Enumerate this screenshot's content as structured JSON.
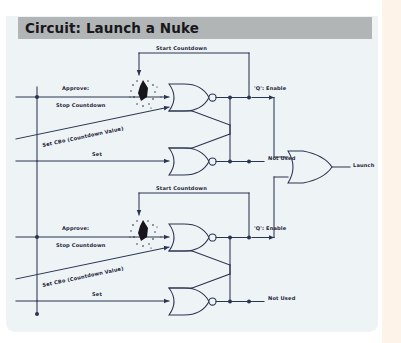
{
  "header": {
    "title": "Circuit: Launch a Nuke"
  },
  "colors": {
    "page_background": "#eef3f6",
    "header_bar": "#b2b5b5",
    "wire": "#2b3450",
    "text": "#1d2436",
    "gutter": "#fdf3e8",
    "burst": "#16161c"
  },
  "diagram": {
    "type": "logic-circuit",
    "final_output_label": "Launch",
    "final_gate": "OR",
    "latches": [
      {
        "id": "latch-top",
        "gates": [
          "NOR",
          "NOR"
        ],
        "inputs": [
          {
            "name": "approve",
            "label": "Approve:"
          },
          {
            "name": "stop-countdown",
            "label": "Stop Countdown"
          },
          {
            "name": "set-cbo",
            "label": "Set CBo (Countdown Value)"
          },
          {
            "name": "set",
            "label": "Set"
          }
        ],
        "feedback_label": "Start Countdown",
        "outputs": [
          {
            "name": "q-enable",
            "label": "'Q': Enable"
          },
          {
            "name": "not-used",
            "label": "Not Used"
          }
        ],
        "burst_icon": "explosion-burst-icon"
      },
      {
        "id": "latch-bottom",
        "gates": [
          "NOR",
          "NOR"
        ],
        "inputs": [
          {
            "name": "approve",
            "label": "Approve:"
          },
          {
            "name": "stop-countdown",
            "label": "Stop Countdown"
          },
          {
            "name": "set-cbo",
            "label": "Set CBo (Countdown Value)"
          },
          {
            "name": "set",
            "label": "Set"
          }
        ],
        "feedback_label": "Start Countdown",
        "outputs": [
          {
            "name": "q-enable",
            "label": "'Q': Enable"
          },
          {
            "name": "not-used",
            "label": "Not Used"
          }
        ],
        "burst_icon": "explosion-burst-icon"
      }
    ]
  }
}
